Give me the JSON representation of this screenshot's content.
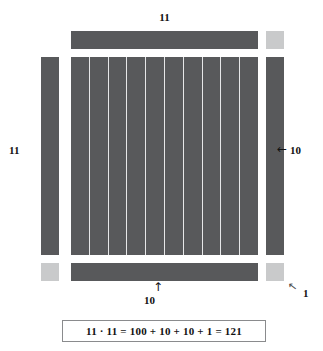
{
  "figure": {
    "title_concept": "area-model-of-11-times-11",
    "colors": {
      "block_dark": "#58595b",
      "block_light": "#c9cacb",
      "grid_line": "#e6e7e8",
      "text": "#111111",
      "box_border": "#8a8b8d",
      "background": "#ffffff"
    }
  },
  "labels": {
    "top": "11",
    "left": "11",
    "right": "10",
    "bottom": "10",
    "unit": "1"
  },
  "arrows": {
    "right": "←",
    "bottom": "↑",
    "unit": "↖"
  },
  "grid": {
    "columns": 10,
    "rows": 10,
    "area": 100
  },
  "bars": {
    "top": {
      "label": "10 by 1 strip",
      "units": 10
    },
    "bottom": {
      "label": "10 by 1 strip",
      "units": 10
    },
    "left": {
      "label": "1 by 10 strip",
      "units": 10
    },
    "right": {
      "label": "1 by 10 strip",
      "units": 10
    }
  },
  "unit_squares": {
    "top_right": {
      "units": 1
    },
    "bottom_left": {
      "units": 1
    },
    "bottom_right": {
      "units": 1
    }
  },
  "equation": {
    "text": "11 · 11 = 100 + 10 + 10 + 1 = 121"
  },
  "chart_data": {
    "type": "diagram",
    "title": "11 · 11 = 100 + 10 + 10 + 1 = 121",
    "decomposition": [
      {
        "part": "core square",
        "dimensions": "10 × 10",
        "value": 100
      },
      {
        "part": "bottom strip",
        "dimensions": "10 × 1",
        "value": 10
      },
      {
        "part": "right strip",
        "dimensions": "1 × 10",
        "value": 10
      },
      {
        "part": "corner unit",
        "dimensions": "1 × 1",
        "value": 1
      }
    ],
    "total": 121,
    "side_length": 11
  }
}
